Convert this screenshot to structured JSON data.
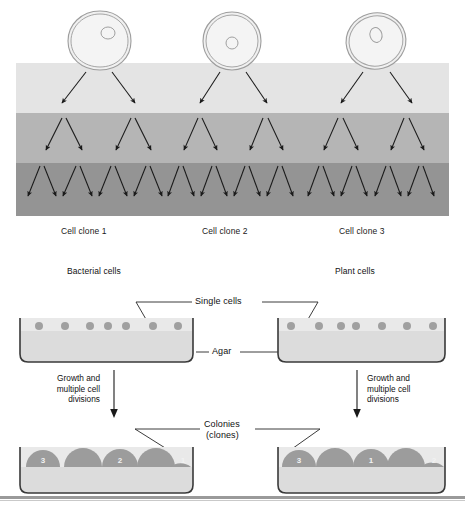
{
  "figure": {
    "title_top": "Cell clone series",
    "background": "#ffffff",
    "bottom_rule_color": "#9a9a9a"
  },
  "top_panel": {
    "bands": [
      {
        "name": "first-division-band",
        "fill": "#e4e4e4",
        "label": "light"
      },
      {
        "name": "second-division-band",
        "fill": "#b5b5b5",
        "label": "medium"
      },
      {
        "name": "third-division-band",
        "fill": "#949494",
        "label": "dark"
      }
    ],
    "cells": [
      {
        "id": "cell-1",
        "shape": "irregular-blob",
        "cx": 99,
        "cy": 40,
        "rx": 32,
        "ry": 28,
        "nucleus_cx": 107,
        "nucleus_cy": 33,
        "nucleus_r": 6.5
      },
      {
        "id": "cell-2",
        "shape": "round",
        "cx": 232,
        "cy": 40,
        "rx": 29,
        "ry": 28,
        "nucleus_cx": 232,
        "nucleus_cy": 42,
        "nucleus_r": 6.0
      },
      {
        "id": "cell-3",
        "shape": "oval-tilted",
        "cx": 376,
        "cy": 40,
        "rx": 30,
        "ry": 28,
        "nucleus_cx": 376,
        "nucleus_cy": 35,
        "nucleus_r": 6.5
      }
    ],
    "clone_labels": [
      {
        "text": "Cell clone 1",
        "x": 61
      },
      {
        "text": "Cell clone 2",
        "x": 202
      },
      {
        "text": "Cell clone 3",
        "x": 339
      }
    ],
    "cell_outline_color": "#9a9a9a",
    "arrow_color": "#1a1a1a"
  },
  "bottom_panel": {
    "headers": [
      {
        "name": "bacterial-cells-header",
        "text": "Bacterial cells",
        "x": 67,
        "y": 271
      },
      {
        "name": "plant-cells-header",
        "text": "Plant cells",
        "x": 335,
        "y": 271
      }
    ],
    "callouts": [
      {
        "name": "single-cells-callout",
        "text": "Single cells",
        "x": 196,
        "y": 301
      },
      {
        "name": "agar-callout",
        "text": "Agar",
        "x": 216,
        "y": 351
      },
      {
        "name": "colonies-callout-l1",
        "text": "Colonies",
        "x": 209,
        "y": 424
      },
      {
        "name": "colonies-callout-l2",
        "text": "(clones)",
        "x": 211,
        "y": 435
      }
    ],
    "growth_text": "Growth and\nmultiple cell\ndivisions",
    "growth_arrows": [
      {
        "name": "growth-arrow-left",
        "x": 113,
        "y_start": 372,
        "y_end": 415
      },
      {
        "name": "growth-arrow-right",
        "x": 356,
        "y_start": 372,
        "y_end": 415
      }
    ],
    "dishes": [
      {
        "name": "bacterial-single-cell-dish",
        "x": 17,
        "y": 318,
        "w": 178,
        "h": 44,
        "agar_fill": "#dcdcdc",
        "surface_fill": "#e9e9e9",
        "cell_fill": "#a0a0a0",
        "cells_x": [
          32,
          56,
          79,
          96,
          113,
          139,
          163
        ]
      },
      {
        "name": "plant-single-cell-dish",
        "x": 278,
        "y": 318,
        "w": 170,
        "h": 44,
        "agar_fill": "#dcdcdc",
        "surface_fill": "#e9e9e9",
        "cell_fill": "#a0a0a0",
        "cells_x": [
          16,
          44,
          67,
          81,
          108,
          133,
          159
        ]
      },
      {
        "name": "bacterial-colony-dish",
        "x": 17,
        "y": 447,
        "w": 178,
        "h": 44,
        "agar_fill": "#dcdcdc",
        "surface_fill": "#e9e9e9",
        "colony_fill": "#9c9c9c",
        "colonies": [
          {
            "cx": 26,
            "r": 17,
            "label": "3"
          },
          {
            "cx": 62,
            "r": 19,
            "label": ""
          },
          {
            "cx": 98,
            "r": 18,
            "label": "2"
          },
          {
            "cx": 133,
            "r": 19,
            "label": ""
          },
          {
            "cx": 165,
            "r": 17,
            "label": "1"
          }
        ]
      },
      {
        "name": "plant-colony-dish",
        "x": 278,
        "y": 447,
        "w": 170,
        "h": 44,
        "agar_fill": "#dcdcdc",
        "surface_fill": "#e9e9e9",
        "colony_fill": "#9c9c9c",
        "colonies": [
          {
            "cx": 24,
            "r": 17,
            "label": "3"
          },
          {
            "cx": 58,
            "r": 19,
            "label": ""
          },
          {
            "cx": 92,
            "r": 18,
            "label": "1"
          },
          {
            "cx": 126,
            "r": 19,
            "label": ""
          },
          {
            "cx": 157,
            "r": 17,
            "label": "2"
          }
        ]
      }
    ],
    "dish_border_color": "#3a3a3a",
    "leader_line_color": "#222222"
  }
}
